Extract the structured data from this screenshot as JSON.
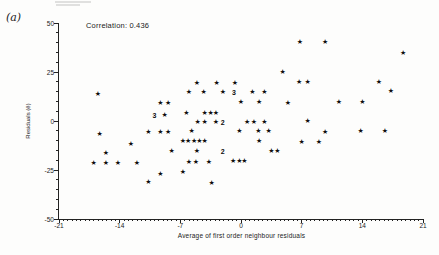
{
  "figure": {
    "panel_label": "(a)",
    "annotation": "Correlation: 0.436"
  },
  "chart_data": {
    "type": "scatter",
    "title": "",
    "xlabel": "Average of first order neighbour residuals",
    "ylabel": "Residuals (ê)",
    "xlim": [
      -21,
      21
    ],
    "ylim": [
      -50,
      50
    ],
    "x_major_ticks": [
      -21,
      -14,
      -7,
      0,
      7,
      14,
      21
    ],
    "y_major_ticks": [
      50,
      25,
      0,
      -25,
      -50
    ],
    "x_minor_step": 0.5,
    "y_minor_step": 5,
    "legend": "none",
    "grid": false,
    "marker": "★",
    "correlation": 0.436,
    "points": [
      [
        6.8,
        40.3
      ],
      [
        9.7,
        40.3
      ],
      [
        18.7,
        34.7
      ],
      [
        4.8,
        25.0
      ],
      [
        6.7,
        19.9
      ],
      [
        7.7,
        19.9
      ],
      [
        15.9,
        19.9
      ],
      [
        -5.1,
        19.4
      ],
      [
        -2.8,
        19.4
      ],
      [
        -0.7,
        19.4
      ],
      [
        -16.5,
        13.8
      ],
      [
        -6.0,
        14.8
      ],
      [
        -4.3,
        14.8
      ],
      [
        -2.1,
        14.8
      ],
      [
        1.3,
        14.8
      ],
      [
        2.7,
        14.8
      ],
      [
        17.3,
        15.3
      ],
      [
        -9.3,
        9.2
      ],
      [
        -8.4,
        9.2
      ],
      [
        0.0,
        9.7
      ],
      [
        2.1,
        9.7
      ],
      [
        5.4,
        9.2
      ],
      [
        11.3,
        9.7
      ],
      [
        14.0,
        9.7
      ],
      [
        -8.8,
        3.1
      ],
      [
        -6.3,
        4.1
      ],
      [
        -4.2,
        4.1
      ],
      [
        -3.5,
        4.1
      ],
      [
        -2.9,
        4.1
      ],
      [
        7.7,
        0.0
      ],
      [
        -5.0,
        -0.5
      ],
      [
        -4.2,
        -0.5
      ],
      [
        -2.9,
        -0.5
      ],
      [
        0.7,
        -0.5
      ],
      [
        1.5,
        -0.5
      ],
      [
        2.7,
        -0.5
      ],
      [
        -10.7,
        -5.4
      ],
      [
        -9.3,
        -5.4
      ],
      [
        -8.4,
        -5.4
      ],
      [
        -5.7,
        -5.2
      ],
      [
        -0.2,
        -5.2
      ],
      [
        2.0,
        -5.1
      ],
      [
        3.2,
        -5.1
      ],
      [
        9.7,
        -5.5
      ],
      [
        13.8,
        -5.3
      ],
      [
        16.6,
        -5.3
      ],
      [
        -16.3,
        -6.6
      ],
      [
        -12.7,
        -11.9
      ],
      [
        -6.7,
        -10.2
      ],
      [
        -6.1,
        -10.2
      ],
      [
        -5.4,
        -10.2
      ],
      [
        -4.8,
        -10.2
      ],
      [
        -4.2,
        -10.2
      ],
      [
        2.1,
        -10.2
      ],
      [
        7.0,
        -10.6
      ],
      [
        9.0,
        -10.6
      ],
      [
        -15.6,
        -16.3
      ],
      [
        -8.0,
        -15.1
      ],
      [
        -5.1,
        -15.3
      ],
      [
        3.5,
        -15.3
      ],
      [
        4.2,
        -15.3
      ],
      [
        -17.0,
        -21.4
      ],
      [
        -15.6,
        -21.4
      ],
      [
        -14.2,
        -21.4
      ],
      [
        -12.0,
        -21.4
      ],
      [
        -6.0,
        -20.7
      ],
      [
        -5.2,
        -20.7
      ],
      [
        -3.7,
        -20.7
      ],
      [
        -0.9,
        -20.4
      ],
      [
        -0.2,
        -20.4
      ],
      [
        0.4,
        -20.4
      ],
      [
        -9.3,
        -26.8
      ],
      [
        -6.7,
        -25.8
      ],
      [
        -10.7,
        -31.1
      ],
      [
        -3.4,
        -31.4
      ]
    ],
    "overlap_count_labels": [
      {
        "text": "3",
        "x": -0.8,
        "y": 14.8
      },
      {
        "text": "3",
        "x": -10.0,
        "y": 3.1
      },
      {
        "text": "2",
        "x": -2.1,
        "y": -0.5
      },
      {
        "text": "2",
        "x": -2.1,
        "y": -15.1
      }
    ]
  }
}
